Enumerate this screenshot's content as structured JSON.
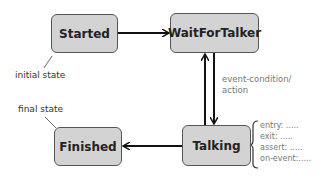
{
  "diagram": {
    "type": "state-machine",
    "states": [
      {
        "id": "started",
        "label": "Started"
      },
      {
        "id": "wait_for_talker",
        "label": "WaitForTalker"
      },
      {
        "id": "talking",
        "label": "Talking"
      },
      {
        "id": "finished",
        "label": "Finished"
      }
    ],
    "transitions": [
      {
        "from": "started",
        "to": "wait_for_talker"
      },
      {
        "from": "wait_for_talker",
        "to": "talking",
        "label": "event-condition/\naction"
      },
      {
        "from": "talking",
        "to": "wait_for_talker"
      },
      {
        "from": "talking",
        "to": "finished"
      }
    ],
    "annotations": {
      "initial_state": "initial state",
      "final_state": "final state",
      "transition_label_line1": "event-condition/",
      "transition_label_line2": "action"
    },
    "talking_details": [
      "entry: .....",
      "exit: .....",
      "assert: .....",
      "on-event:....."
    ]
  }
}
